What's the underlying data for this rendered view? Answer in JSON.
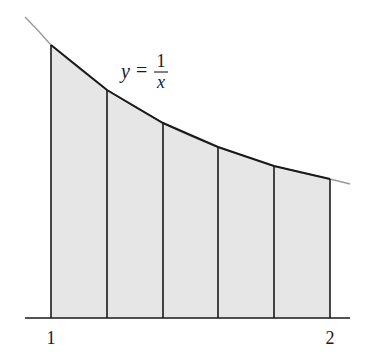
{
  "figure": {
    "curve_label": {
      "y": "y",
      "eq": "=",
      "num": "1",
      "den": "x"
    },
    "axis": {
      "tick_labels": [
        {
          "text": "1",
          "x": 51
        },
        {
          "text": "2",
          "x": 330
        }
      ]
    },
    "colors": {
      "fill": "#e6e6e6",
      "stroke": "#1a1a1a",
      "curve_tail": "#9a9a9a"
    },
    "trapezoids": {
      "count": 5,
      "x_start": 1,
      "x_end": 2,
      "vertices": [
        {
          "x": 1.0,
          "y": 1.0
        },
        {
          "x": 1.2,
          "y": 0.8333
        },
        {
          "x": 1.4,
          "y": 0.7143
        },
        {
          "x": 1.6,
          "y": 0.625
        },
        {
          "x": 1.8,
          "y": 0.5556
        },
        {
          "x": 2.0,
          "y": 0.5
        }
      ]
    }
  }
}
